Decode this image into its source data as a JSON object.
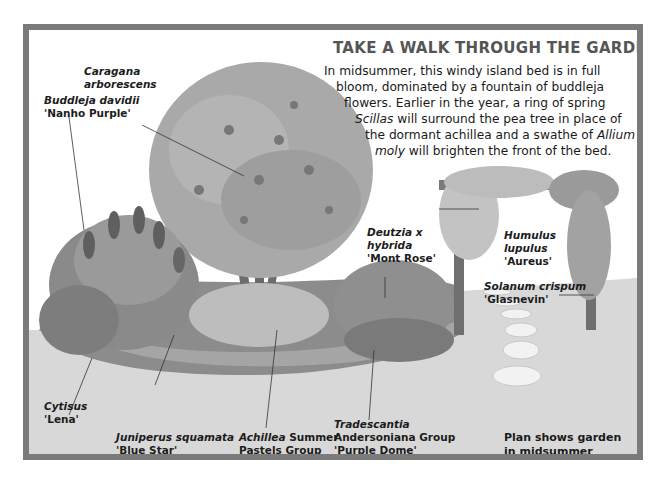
{
  "heading": {
    "title": "TAKE A WALK THROUGH THE GARDEN",
    "lines": [
      {
        "pre": "In midsummer, this windy island bed is in full",
        "em": "",
        "post": ""
      },
      {
        "pre": "bloom, dominated by a fountain of buddleja",
        "em": "",
        "post": ""
      },
      {
        "pre": "flowers. Earlier in the year, a ring of spring",
        "em": "",
        "post": ""
      },
      {
        "pre": "",
        "em": "Scillas",
        "post": " will surround the pea tree in place of"
      },
      {
        "pre": "the dormant achillea and a swathe of ",
        "em": "Allium",
        "post": ""
      },
      {
        "pre": "",
        "em": "moly",
        "post": " will brighten the front of the bed."
      }
    ]
  },
  "labels": {
    "caragana": {
      "line1": "Caragana",
      "line2": "arborescens"
    },
    "buddleja": {
      "line1": "Buddleja davidii",
      "line2": "'Nanho Purple'"
    },
    "deutzia": {
      "line1": "Deutzia x",
      "line2": "hybrida",
      "line3": "'Mont Rose'"
    },
    "humulus": {
      "line1": "Humulus",
      "line2": "lupulus",
      "line3": "'Aureus'"
    },
    "solanum": {
      "line1": "Solanum crispum",
      "line2": "'Glasnevin'"
    },
    "cytisus": {
      "line1": "Cytisus",
      "line2": "'Lena'"
    },
    "juniperus": {
      "line1": "Juniperus squamata",
      "line2": "'Blue Star'"
    },
    "achillea": {
      "line1_em": "Achillea",
      "line1_rest": " Summer",
      "line2": "Pastels Group"
    },
    "tradescantia": {
      "line1": "Tradescantia",
      "line2": "Andersoniana Group",
      "line3": "'Purple Dome'"
    }
  },
  "note": {
    "line1": "Plan shows garden",
    "line2": "in midsummer"
  },
  "colors": {
    "frame": "#7b7b7b",
    "ground": "#d9d9d9",
    "title": "#555555"
  }
}
